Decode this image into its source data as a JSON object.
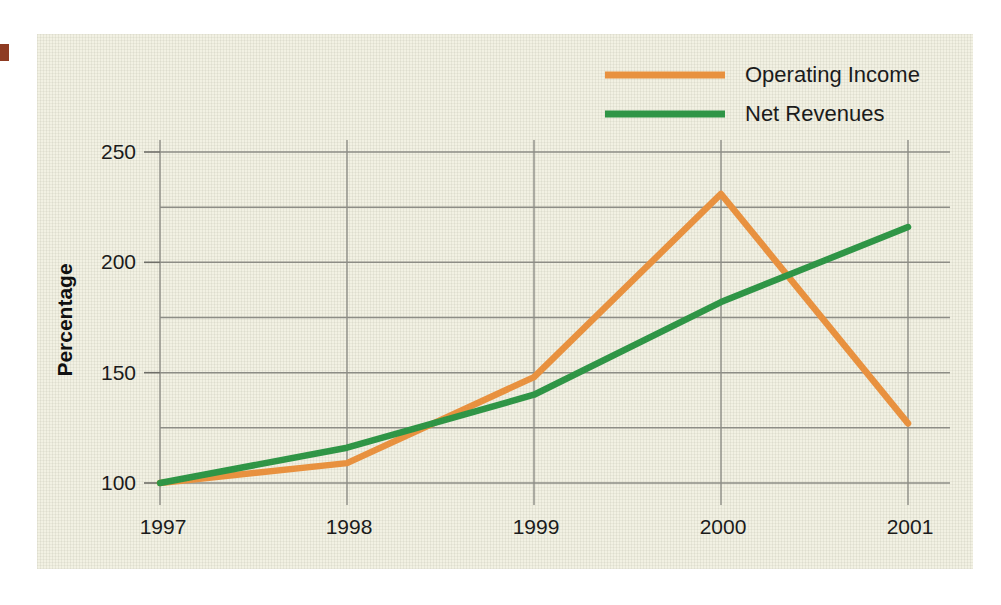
{
  "chart_data": {
    "type": "line",
    "title": "",
    "xlabel": "",
    "ylabel": "Percentage",
    "categories": [
      "1997",
      "1998",
      "1999",
      "2000",
      "2001"
    ],
    "x": [
      1997,
      1998,
      1999,
      2000,
      2001
    ],
    "xlim": [
      1997,
      2001
    ],
    "ylim": [
      100,
      250
    ],
    "yticks": [
      100,
      150,
      200,
      250
    ],
    "ytick_labels": [
      "100",
      "150",
      "200",
      "250"
    ],
    "ygridlines": [
      100,
      125,
      150,
      175,
      200,
      225,
      250
    ],
    "xgridlines": [
      1997,
      1998,
      1999,
      2000,
      2001
    ],
    "grid": true,
    "legend_position": "top-right",
    "series": [
      {
        "name": "Operating Income",
        "color": "#e8913f",
        "values": [
          100,
          109,
          148,
          231,
          127
        ]
      },
      {
        "name": "Net Revenues",
        "color": "#2f9546",
        "values": [
          100,
          116,
          140,
          182,
          216
        ]
      }
    ]
  },
  "axes": {
    "y_title": "Percentage",
    "y_tick_labels": [
      "250",
      "200",
      "150",
      "100"
    ],
    "x_tick_labels": [
      "1997",
      "1998",
      "1999",
      "2000",
      "2001"
    ]
  },
  "legend": {
    "entries": [
      {
        "label": "Operating Income",
        "color": "#e8913f"
      },
      {
        "label": "Net Revenues",
        "color": "#2f9546"
      }
    ]
  },
  "colors": {
    "panel_background": "#f2f1e3",
    "page_background": "#ffffff",
    "gridline": "#8d8d86",
    "axis": "#6e6e68",
    "text": "#1b1b1b",
    "operating_income": "#e8913f",
    "net_revenues": "#2f9546",
    "edge_marker": "#8e3b22"
  }
}
